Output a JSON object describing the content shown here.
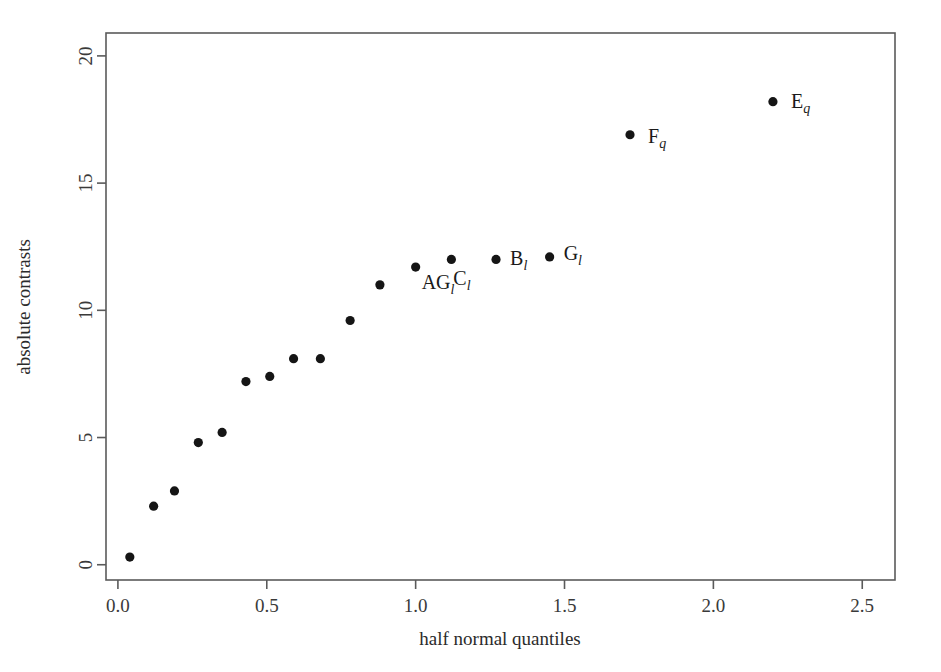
{
  "chart_data": {
    "type": "scatter",
    "title": "",
    "xlabel": "half normal quantiles",
    "ylabel": "absolute contrasts",
    "xlim": [
      -0.04,
      2.61
    ],
    "ylim": [
      -0.6,
      20.9
    ],
    "xticks": [
      "0.0",
      "0.5",
      "1.0",
      "1.5",
      "2.0",
      "2.5"
    ],
    "xtick_values": [
      0.0,
      0.5,
      1.0,
      1.5,
      2.0,
      2.5
    ],
    "yticks": [
      "0",
      "5",
      "10",
      "15",
      "20"
    ],
    "ytick_values": [
      0,
      5,
      10,
      15,
      20
    ],
    "grid": false,
    "legend": "none",
    "x": [
      0.04,
      0.12,
      0.19,
      0.27,
      0.35,
      0.43,
      0.51,
      0.59,
      0.68,
      0.78,
      0.88,
      1.0,
      1.12,
      1.27,
      1.45,
      1.72,
      2.2
    ],
    "y": [
      0.3,
      2.3,
      2.9,
      4.8,
      5.2,
      7.2,
      7.4,
      8.1,
      8.1,
      9.6,
      11.0,
      11.7,
      12.0,
      12.0,
      12.1,
      16.9,
      18.2
    ],
    "points": [
      {
        "x": 0.04,
        "y": 0.3,
        "label": "",
        "sub": ""
      },
      {
        "x": 0.12,
        "y": 2.3,
        "label": "",
        "sub": ""
      },
      {
        "x": 0.19,
        "y": 2.9,
        "label": "",
        "sub": ""
      },
      {
        "x": 0.27,
        "y": 4.8,
        "label": "",
        "sub": ""
      },
      {
        "x": 0.35,
        "y": 5.2,
        "label": "",
        "sub": ""
      },
      {
        "x": 0.43,
        "y": 7.2,
        "label": "",
        "sub": ""
      },
      {
        "x": 0.51,
        "y": 7.4,
        "label": "",
        "sub": ""
      },
      {
        "x": 0.59,
        "y": 8.1,
        "label": "",
        "sub": ""
      },
      {
        "x": 0.68,
        "y": 8.1,
        "label": "",
        "sub": ""
      },
      {
        "x": 0.78,
        "y": 9.6,
        "label": "",
        "sub": ""
      },
      {
        "x": 0.88,
        "y": 11.0,
        "label": "",
        "sub": ""
      },
      {
        "x": 1.0,
        "y": 11.7,
        "label": "AG",
        "sub": "l",
        "dx": 6,
        "dy": 22
      },
      {
        "x": 1.12,
        "y": 12.0,
        "label": "C",
        "sub": "l",
        "dx": 2,
        "dy": 26
      },
      {
        "x": 1.27,
        "y": 12.0,
        "label": "B",
        "sub": "l",
        "dx": 14,
        "dy": 6
      },
      {
        "x": 1.45,
        "y": 12.1,
        "label": "G",
        "sub": "l",
        "dx": 14,
        "dy": 3
      },
      {
        "x": 1.72,
        "y": 16.9,
        "label": "F",
        "sub": "q",
        "dx": 18,
        "dy": 8
      },
      {
        "x": 2.2,
        "y": 18.2,
        "label": "E",
        "sub": "q",
        "dx": 18,
        "dy": 6
      }
    ]
  },
  "axes": {
    "x_title": "half normal quantiles",
    "y_title": "absolute contrasts",
    "x_tick_labels": [
      "0.0",
      "0.5",
      "1.0",
      "1.5",
      "2.0",
      "2.5"
    ],
    "y_tick_labels": [
      "0",
      "5",
      "10",
      "15",
      "20"
    ]
  },
  "labels": {
    "ag_l": "AG",
    "ag_l_sub": "l",
    "c_l": "C",
    "c_l_sub": "l",
    "b_l": "B",
    "b_l_sub": "l",
    "g_l": "G",
    "g_l_sub": "l",
    "f_q": "F",
    "f_q_sub": "q",
    "e_q": "E",
    "e_q_sub": "q"
  },
  "colors": {
    "point": "#151515",
    "axis": "#5a5a5a",
    "text": "#2b2b2b",
    "background": "#ffffff"
  }
}
